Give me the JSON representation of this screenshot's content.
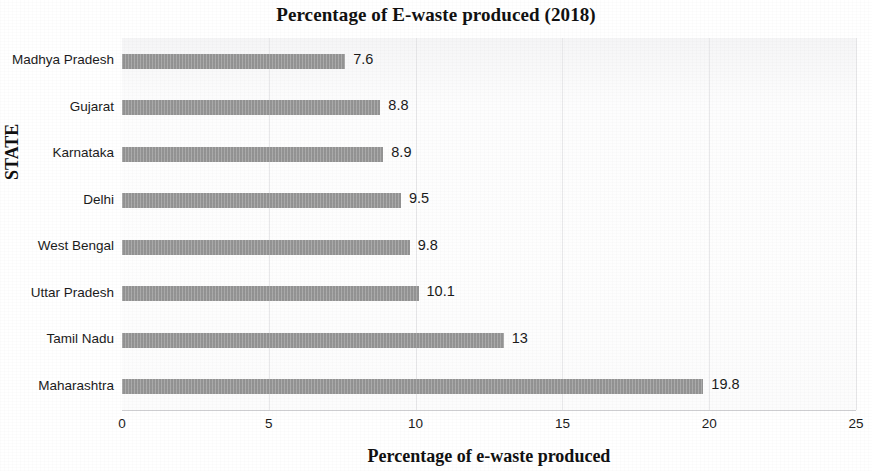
{
  "chart_data": {
    "type": "bar",
    "orientation": "horizontal",
    "title": "Percentage of E-waste produced (2018)",
    "xlabel": "Percentage of e-waste produced",
    "ylabel": "STATE",
    "categories": [
      "Madhya Pradesh",
      "Gujarat",
      "Karnataka",
      "Delhi",
      "West Bengal",
      "Uttar Pradesh",
      "Tamil Nadu",
      "Maharashtra"
    ],
    "values": [
      7.6,
      8.8,
      8.9,
      9.5,
      9.8,
      10.1,
      13,
      19.8
    ],
    "value_labels": [
      "7.6",
      "8.8",
      "8.9",
      "9.5",
      "9.8",
      "10.1",
      "13",
      "19.8"
    ],
    "xlim": [
      0,
      25
    ],
    "xticks": [
      0,
      5,
      10,
      15,
      20,
      25
    ],
    "xtick_labels": [
      "0",
      "5",
      "10",
      "15",
      "20",
      "25"
    ],
    "grid": true,
    "grid_axis": "x",
    "legend": false,
    "bar_color": "#9b9b9b",
    "text_color": "#1b1b1b",
    "background_color": "#ffffff"
  }
}
